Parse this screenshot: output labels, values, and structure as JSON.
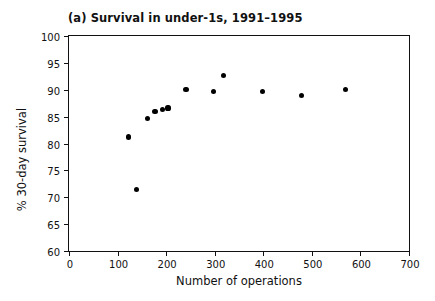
{
  "chart_data": {
    "type": "scatter",
    "title": "(a) Survival in under-1s, 1991–1995",
    "xlabel": "Number of operations",
    "ylabel": "% 30-day survival",
    "xlim": [
      0,
      700
    ],
    "ylim": [
      60,
      100
    ],
    "xticks": [
      0,
      100,
      200,
      300,
      400,
      500,
      600,
      700
    ],
    "yticks": [
      60,
      65,
      70,
      75,
      80,
      85,
      90,
      95,
      100
    ],
    "grid": false,
    "legend": null,
    "marker_color": "#000000",
    "axis_color": "#111111",
    "background": "#ffffff",
    "points": [
      {
        "x": 122,
        "y": 81.2
      },
      {
        "x": 139,
        "y": 71.5
      },
      {
        "x": 161,
        "y": 84.6
      },
      {
        "x": 177,
        "y": 85.9
      },
      {
        "x": 192,
        "y": 86.4
      },
      {
        "x": 204,
        "y": 86.6
      },
      {
        "x": 241,
        "y": 90.0
      },
      {
        "x": 297,
        "y": 89.7
      },
      {
        "x": 318,
        "y": 92.6
      },
      {
        "x": 398,
        "y": 89.7
      },
      {
        "x": 478,
        "y": 89.0
      },
      {
        "x": 570,
        "y": 90.1
      }
    ]
  }
}
